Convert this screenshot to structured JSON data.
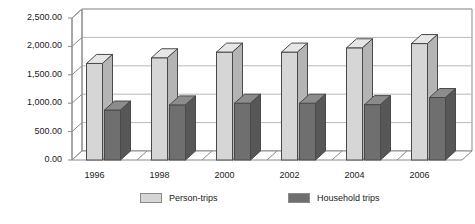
{
  "chart_data": {
    "type": "bar",
    "title": "",
    "subtitle": "",
    "xlabel": "",
    "ylabel": "",
    "categories": [
      "1996",
      "1998",
      "2000",
      "2002",
      "2004",
      "2006"
    ],
    "series": [
      {
        "name": "Person-trips",
        "color": "#d6d6d6",
        "values": [
          1700,
          1800,
          1900,
          1900,
          1975,
          2050
        ]
      },
      {
        "name": "Household trips",
        "color": "#6f6f6f",
        "values": [
          880,
          970,
          1000,
          1000,
          975,
          1100
        ]
      }
    ],
    "ylim": [
      0,
      2500
    ],
    "yticks": [
      0,
      500,
      1000,
      1500,
      2000,
      2500
    ],
    "ytick_labels": [
      "0.00",
      "500.00",
      "1,000.00",
      "1,500.00",
      "2,000.00",
      "2,500.00"
    ],
    "grid": true,
    "grid_axis": "y",
    "legend_position": "bottom",
    "style": "3d-columns"
  },
  "legend": {
    "entries": [
      {
        "label": "Person-trips",
        "swatch": "light"
      },
      {
        "label": "Household trips",
        "swatch": "dark"
      }
    ]
  },
  "colors": {
    "person_trips": "#d6d6d6",
    "person_trips_top": "#e6e6e6",
    "person_trips_side": "#b4b4b4",
    "household_trips": "#6f6f6f",
    "household_trips_top": "#8c8c8c",
    "household_trips_side": "#575757",
    "axis": "#8a8a8a",
    "grid": "#b9b9b9",
    "text": "#1a1a1a",
    "background": "#ffffff"
  }
}
